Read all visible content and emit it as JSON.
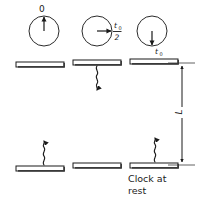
{
  "figure": {
    "background_color": "#ffffff",
    "ink_color": "#1a1a1a",
    "width": 205,
    "height": 200
  },
  "clocks": [
    {
      "id": "clock-start",
      "label": "0",
      "hand_direction": "up",
      "label_position": "above",
      "cx": 44,
      "cy": 31,
      "r": 15
    },
    {
      "id": "clock-half",
      "label_numerator": "t",
      "label_numerator_sub": "0",
      "label_denominator": "2",
      "hand_direction": "right",
      "label_position": "right",
      "cx": 97,
      "cy": 31,
      "r": 15
    },
    {
      "id": "clock-full",
      "label": "t",
      "label_sub": "0",
      "hand_direction": "down",
      "label_position": "below",
      "cx": 152,
      "cy": 31,
      "r": 15
    }
  ],
  "mirrors": [
    {
      "id": "top-mirror-left",
      "x": 16,
      "y": 62,
      "w": 48,
      "h": 5
    },
    {
      "id": "top-mirror-mid",
      "x": 73,
      "y": 60,
      "w": 48,
      "h": 5
    },
    {
      "id": "top-mirror-right",
      "x": 130,
      "y": 59,
      "w": 48,
      "h": 5
    },
    {
      "id": "bottom-mirror-left",
      "x": 16,
      "y": 166,
      "w": 48,
      "h": 5
    },
    {
      "id": "bottom-mirror-mid",
      "x": 73,
      "y": 163,
      "w": 48,
      "h": 5
    },
    {
      "id": "bottom-mirror-right",
      "x": 130,
      "y": 163,
      "w": 48,
      "h": 5
    }
  ],
  "light_pulses": [
    {
      "id": "pulse-down-mid",
      "direction": "down",
      "x": 97,
      "y_start": 67,
      "y_end": 92
    },
    {
      "id": "pulse-up-left",
      "direction": "up",
      "x": 44,
      "y_start": 164,
      "y_end": 139
    },
    {
      "id": "pulse-up-right",
      "direction": "up",
      "x": 155,
      "y_start": 161,
      "y_end": 136
    }
  ],
  "dimension": {
    "id": "length-L",
    "label": "L",
    "x": 182,
    "y_top": 65,
    "y_bottom": 164,
    "ext_top_x1": 168,
    "ext_bottom_x1": 168
  },
  "caption": {
    "line1": "Clock at",
    "line2": "rest",
    "x": 128,
    "y": 182
  }
}
